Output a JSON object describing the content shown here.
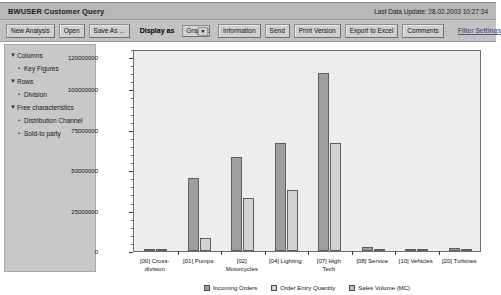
{
  "window": {
    "title": "BWUSER Customer Query",
    "last_update_label": "Last Data Update: 28.02.2003 10:27:34"
  },
  "toolbar": {
    "new_analysis": "New Analysis",
    "open": "Open",
    "save_as": "Save As ...",
    "display_as_label": "Display as",
    "display_as_value": "Graphic",
    "display_as_arrow": "▼",
    "information": "Information",
    "send": "Send",
    "print_version": "Print Version",
    "export_to_excel": "Export to Excel",
    "comments": "Comments",
    "filter_settings": "Filter Settings"
  },
  "sidebar": {
    "items": [
      {
        "label": "Columns",
        "level": 0,
        "marker": "▼"
      },
      {
        "label": "Key Figures",
        "level": 1,
        "marker": "•"
      },
      {
        "label": "Rows",
        "level": 0,
        "marker": "▼"
      },
      {
        "label": "Division",
        "level": 1,
        "marker": "•"
      },
      {
        "label": "Free characteristics",
        "level": 0,
        "marker": "▼"
      },
      {
        "label": "Distribution Channel",
        "level": 1,
        "marker": "•"
      },
      {
        "label": "Sold-to party",
        "level": 1,
        "marker": "•"
      }
    ]
  },
  "chart_data": {
    "type": "bar",
    "title": "",
    "xlabel": "",
    "ylabel": "",
    "ylim": [
      0,
      125000000
    ],
    "grid": false,
    "legend_position": "bottom",
    "yticks": [
      0,
      25000000,
      50000000,
      75000000,
      100000000,
      120000000
    ],
    "ytick_labels": [
      "0",
      "25000000",
      "50000000",
      "75000000",
      "100000000",
      "120000000"
    ],
    "categories": [
      "[00] Cross-\ndivision",
      "[01] Pumps",
      "[02]\nMotorcycles",
      "[04] Lighting",
      "[07] High\nTech",
      "[08] Service",
      "[10] Vehicles",
      "[20] Turbines"
    ],
    "series": [
      {
        "name": "Incoming Orders",
        "color": "#9e9e9e",
        "values": [
          300000,
          45000000,
          58000000,
          67000000,
          110000000,
          2200000,
          250000,
          1600000
        ]
      },
      {
        "name": "Order Entry Quantity",
        "color": "#d2d2d2",
        "values": [
          200000,
          8000000,
          33000000,
          38000000,
          67000000,
          300000,
          150000,
          300000
        ]
      },
      {
        "name": "Sales Volume (MC)",
        "color": "#bcbcbc",
        "values": [
          150000,
          0,
          0,
          0,
          0,
          0,
          0,
          0
        ]
      }
    ]
  },
  "colors": {
    "title_bar": "#b8b8b8",
    "toolbar": "#c2c2c2",
    "sidebar": "#c8c8c8",
    "plot_bg": "#ededed",
    "series_1": "#9e9e9e",
    "series_2": "#d2d2d2",
    "series_3": "#bcbcbc"
  }
}
